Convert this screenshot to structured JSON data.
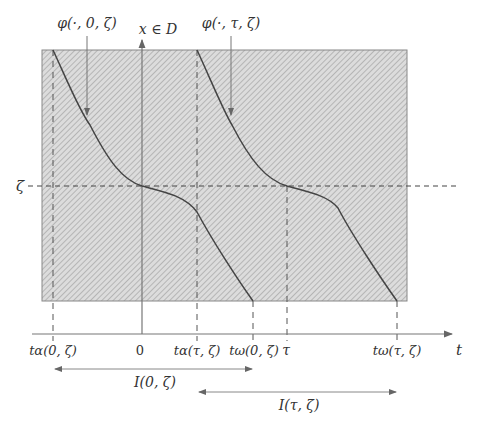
{
  "diagram": {
    "type": "flow-time-interval-diagram",
    "domain_label": "x ∈ D",
    "time_axis_label": "t",
    "level_label": "ζ",
    "curve_labels": [
      {
        "id": "phi0",
        "text": "φ(·, 0, ζ)"
      },
      {
        "id": "phitau",
        "text": "φ(·, τ, ζ)"
      }
    ],
    "tick_labels": [
      {
        "id": "t_alpha_0",
        "text": "tα(0, ζ)"
      },
      {
        "id": "zero",
        "text": "0"
      },
      {
        "id": "t_alpha_tau",
        "text": "tα(τ, ζ)"
      },
      {
        "id": "t_omega_0",
        "text": "tω(0, ζ)"
      },
      {
        "id": "tau",
        "text": "τ"
      },
      {
        "id": "t_omega_tau",
        "text": "tω(τ, ζ)"
      }
    ],
    "intervals": [
      {
        "id": "I0",
        "text": "I(0, ζ)"
      },
      {
        "id": "Itau",
        "text": "I(τ, ζ)"
      }
    ],
    "colors": {
      "region_fill": "#d9d9d9",
      "hatch": "#a8a8a8",
      "lines": "#555555",
      "curve": "#444444"
    }
  }
}
